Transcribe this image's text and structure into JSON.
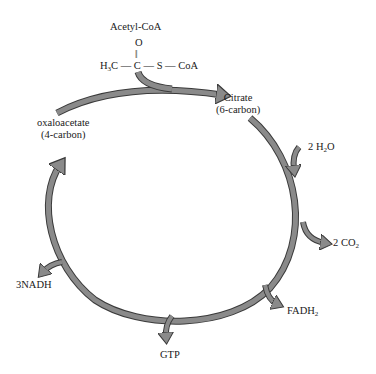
{
  "diagram": {
    "input": {
      "name": "Acetyl-CoA",
      "structure": {
        "top_atom": "O",
        "bond": "||",
        "left": "H",
        "left_sub": "3",
        "left_tail": "C",
        "center": "C",
        "middle": "S",
        "right": "CoA"
      }
    },
    "nodes": {
      "citrate": {
        "name": "Citrate",
        "detail": "(6-carbon)"
      },
      "oxaloacetate": {
        "name": "oxaloacetate",
        "detail": "(4-carbon)"
      }
    },
    "inputs_side": {
      "water": {
        "prefix": "2 H",
        "sub": "2",
        "suffix": "O"
      }
    },
    "outputs": {
      "co2": {
        "prefix": "2 CO",
        "sub": "2"
      },
      "fadh2": {
        "prefix": "FADH",
        "sub": "2"
      },
      "gtp": {
        "label": "GTP"
      },
      "nadh": {
        "label": "3NADH"
      }
    },
    "colors": {
      "arrow_fill": "#8a8a8a",
      "arrow_stroke": "#3a3a3a",
      "text": "#1a1a1a",
      "background": "#ffffff"
    }
  }
}
